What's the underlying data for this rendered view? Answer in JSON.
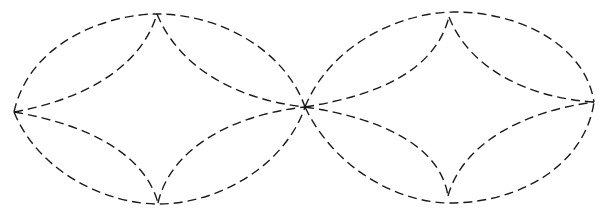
{
  "diagram": {
    "type": "dashed-curve-figure",
    "stroke_color": "#1a1a1a",
    "background": "#ffffff",
    "shapes": [
      {
        "name": "left-lens",
        "vertices": {
          "left": [
            14,
            112
          ],
          "top": [
            157,
            14
          ],
          "right": [
            305,
            107
          ],
          "bottom": [
            158,
            203
          ]
        },
        "outer": {
          "top_arc": "M14,112 C30,40 110,14 157,14 C220,14 285,50 305,107",
          "bottom_arc": "M14,112 C40,175 110,204 158,204 C220,204 285,165 305,107"
        },
        "inner": {
          "top_left": "M14,112 C80,100 140,70 157,14",
          "top_right": "M157,14 C180,70 240,100 305,107",
          "bottom_left": "M14,112 C90,125 145,155 158,203",
          "bottom_right": "M158,203 C170,150 230,115 305,107"
        }
      },
      {
        "name": "right-lens",
        "vertices": {
          "left": [
            305,
            107
          ],
          "top": [
            449,
            17
          ],
          "right": [
            594,
            102
          ],
          "bottom": [
            448,
            196
          ]
        },
        "outer": {
          "top_arc": "M305,107 C330,45 400,12 455,12 C520,12 585,45 594,102",
          "bottom_arc": "M305,107 C335,170 400,203 450,203 C520,203 585,165 594,102"
        },
        "inner": {
          "top_left": "M305,107 C380,95 435,70 449,17",
          "top_right": "M449,17 C470,70 530,98 594,102",
          "bottom_left": "M305,107 C380,118 440,145 448,196",
          "bottom_right": "M448,196 C462,145 520,112 594,102"
        }
      }
    ]
  }
}
